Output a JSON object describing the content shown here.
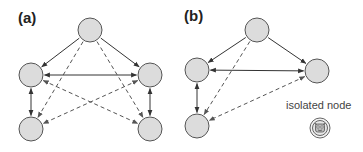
{
  "panels": {
    "a": {
      "label": "(a)",
      "nodes": [
        {
          "id": "top",
          "cx": 90,
          "cy": 30
        },
        {
          "id": "left-mid",
          "cx": 31,
          "cy": 75
        },
        {
          "id": "right-mid",
          "cx": 150,
          "cy": 75
        },
        {
          "id": "left-bottom",
          "cx": 31,
          "cy": 129
        },
        {
          "id": "right-bottom",
          "cx": 150,
          "cy": 129
        }
      ],
      "edges": [
        {
          "from": "top",
          "to": "left-mid",
          "style": "solid",
          "direction": "forward"
        },
        {
          "from": "top",
          "to": "right-mid",
          "style": "solid",
          "direction": "forward"
        },
        {
          "from": "left-mid",
          "to": "right-mid",
          "style": "solid",
          "direction": "both"
        },
        {
          "from": "left-mid",
          "to": "left-bottom",
          "style": "solid",
          "direction": "both"
        },
        {
          "from": "right-mid",
          "to": "right-bottom",
          "style": "solid",
          "direction": "both"
        },
        {
          "from": "top",
          "to": "left-bottom",
          "style": "dashed",
          "direction": "forward"
        },
        {
          "from": "top",
          "to": "right-bottom",
          "style": "dashed",
          "direction": "forward"
        },
        {
          "from": "right-mid",
          "to": "left-bottom",
          "style": "dashed",
          "direction": "both"
        },
        {
          "from": "left-mid",
          "to": "right-bottom",
          "style": "dashed",
          "direction": "both"
        }
      ]
    },
    "b": {
      "label": "(b)",
      "nodes": [
        {
          "id": "top",
          "cx": 257,
          "cy": 30
        },
        {
          "id": "left-mid",
          "cx": 197,
          "cy": 70
        },
        {
          "id": "right-mid",
          "cx": 317,
          "cy": 71
        },
        {
          "id": "left-bottom",
          "cx": 197,
          "cy": 126
        }
      ],
      "edges": [
        {
          "from": "top",
          "to": "left-mid",
          "style": "solid",
          "direction": "forward"
        },
        {
          "from": "top",
          "to": "right-mid",
          "style": "solid",
          "direction": "forward"
        },
        {
          "from": "left-mid",
          "to": "right-mid",
          "style": "solid",
          "direction": "both"
        },
        {
          "from": "left-mid",
          "to": "left-bottom",
          "style": "solid",
          "direction": "both"
        },
        {
          "from": "top",
          "to": "left-bottom",
          "style": "dashed",
          "direction": "forward"
        },
        {
          "from": "right-mid",
          "to": "left-bottom",
          "style": "dashed",
          "direction": "both"
        }
      ],
      "isolated_node": {
        "label": "isolated node",
        "icon": "face-icon",
        "cx": 320,
        "cy": 128
      }
    }
  },
  "colors": {
    "node_fill": "#dcdcdc",
    "node_stroke": "#555555",
    "edge": "#333333",
    "dashed_edge": "#555555"
  }
}
